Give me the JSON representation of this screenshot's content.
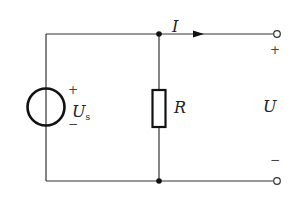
{
  "circuit": {
    "source": {
      "label": "U",
      "subscript": "s",
      "plus": "+",
      "minus": "−"
    },
    "resistor": {
      "label": "R"
    },
    "current": {
      "label": "I"
    },
    "output": {
      "label": "U",
      "plus": "+",
      "minus": "−"
    }
  },
  "colors": {
    "wire": "#333333",
    "background": "#ffffff"
  }
}
